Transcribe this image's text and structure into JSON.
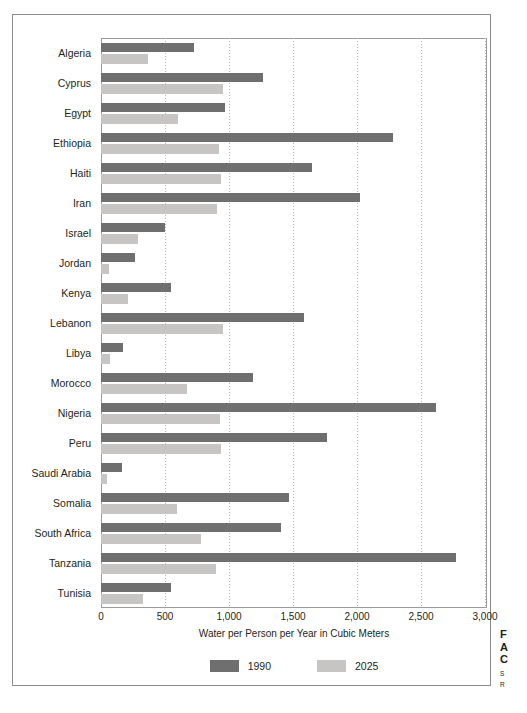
{
  "chart_data": {
    "type": "bar",
    "orientation": "horizontal",
    "title": "",
    "xlabel": "Water per Person per Year in Cubic Meters",
    "ylabel": "",
    "xlim": [
      0,
      3000
    ],
    "xticks": [
      0,
      500,
      1000,
      1500,
      2000,
      2500,
      3000
    ],
    "xtick_labels": [
      "0",
      "500",
      "1,000",
      "1,500",
      "2,000",
      "2,500",
      "3,000"
    ],
    "grid": true,
    "grid_axis": "x",
    "legend_position": "bottom",
    "categories": [
      "Algeria",
      "Cyprus",
      "Egypt",
      "Ethiopia",
      "Haiti",
      "Iran",
      "Israel",
      "Jordan",
      "Kenya",
      "Lebanon",
      "Libya",
      "Morocco",
      "Nigeria",
      "Peru",
      "Saudi Arabia",
      "Somalia",
      "South Africa",
      "Tanzania",
      "Tunisia"
    ],
    "series": [
      {
        "name": "1990",
        "color": "#706f6f",
        "values": [
          730,
          1265,
          965,
          2285,
          1645,
          2025,
          500,
          265,
          545,
          1585,
          175,
          1190,
          2620,
          1765,
          165,
          1470,
          1405,
          2770,
          550
        ]
      },
      {
        "name": "2025",
        "color": "#c6c5c4",
        "values": [
          365,
          955,
          600,
          925,
          940,
          910,
          290,
          65,
          210,
          950,
          70,
          675,
          930,
          940,
          45,
          595,
          785,
          900,
          330
        ]
      }
    ]
  },
  "legend": {
    "items": [
      {
        "label": "1990",
        "color": "#706f6f"
      },
      {
        "label": "2025",
        "color": "#c6c5c4"
      }
    ]
  },
  "caption": {
    "line1": "F",
    "line2": "A",
    "line3": "C",
    "small1": "S",
    "small2": "R"
  }
}
